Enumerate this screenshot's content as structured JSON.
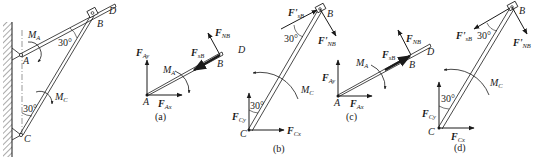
{
  "diagram": {
    "colors": {
      "ink": "#1a1a1a",
      "background": "#ffffff"
    },
    "main_figure": {
      "points": [
        "A",
        "B",
        "C",
        "D"
      ],
      "moments": [
        "M_A",
        "M_C"
      ],
      "angles": [
        "30°",
        "30°"
      ]
    },
    "panels": [
      {
        "caption": "(a)",
        "points": [
          "A",
          "B",
          "D"
        ],
        "forces": [
          "F_Ay",
          "F_Ax",
          "F_sB",
          "F_NB"
        ],
        "moment": "M_A"
      },
      {
        "caption": "(b)",
        "points": [
          "B",
          "C"
        ],
        "forces": [
          "F'_sB",
          "F'_NB",
          "F_Cy",
          "F_Cx"
        ],
        "moment": "M_C",
        "angles": [
          "30°",
          "30°"
        ]
      },
      {
        "caption": "(c)",
        "points": [
          "A",
          "B",
          "D"
        ],
        "forces": [
          "F_Ay",
          "F_Ax",
          "F_sB",
          "F_NB"
        ],
        "moment": "M_A"
      },
      {
        "caption": "(d)",
        "points": [
          "B",
          "C"
        ],
        "forces": [
          "F'_sB",
          "F'_NB",
          "F_Cy",
          "F_Cx"
        ],
        "moment": "M_C",
        "angles": [
          "30°",
          "30°"
        ]
      }
    ]
  },
  "labels": {
    "A": "A",
    "B": "B",
    "C": "C",
    "D": "D",
    "M": "M",
    "F": "F",
    "Fp": "F'",
    "sub_A": "A",
    "sub_C": "C",
    "sub_Ay": "Ay",
    "sub_Ax": "Ax",
    "sub_Cy": "Cy",
    "sub_Cx": "Cx",
    "sub_sB": "sB",
    "sub_NB": "NB",
    "angle30": "30°",
    "cap_a": "(a)",
    "cap_b": "(b)",
    "cap_c": "(c)",
    "cap_d": "(d)"
  }
}
